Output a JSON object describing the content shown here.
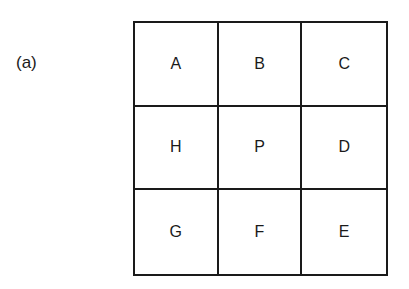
{
  "figure": {
    "label": "(a)",
    "grid": {
      "rows": [
        [
          "A",
          "B",
          "C"
        ],
        [
          "H",
          "P",
          "D"
        ],
        [
          "G",
          "F",
          "E"
        ]
      ]
    }
  }
}
